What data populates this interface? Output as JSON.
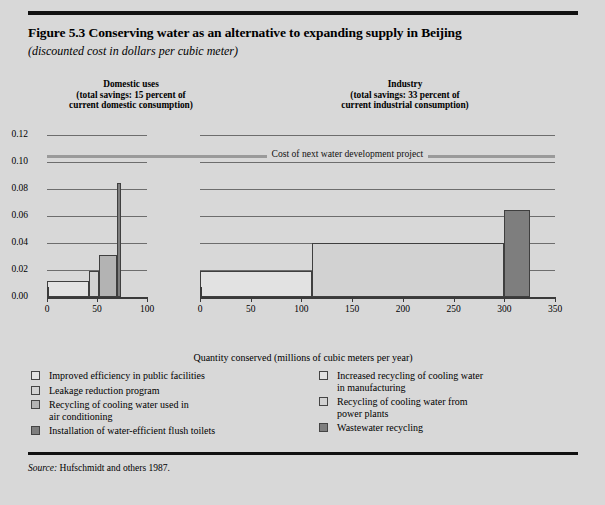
{
  "figure": {
    "title": "Figure 5.3  Conserving water as an alternative to expanding supply in Beijing",
    "subtitle": "(discounted cost in dollars per cubic meter)",
    "source_prefix": "Source:",
    "source_text": " Hufschmidt and others 1987."
  },
  "panels": {
    "left": {
      "heading_line1": "Domestic uses",
      "heading_line2": "(total savings: 15 percent of",
      "heading_line3": "current domestic consumption)"
    },
    "right": {
      "heading_line1": "Industry",
      "heading_line2": "(total savings: 33 percent of",
      "heading_line3": "current industrial consumption)"
    }
  },
  "axes": {
    "x_title": "Quantity conserved (millions of cubic meters per year)",
    "y_ticks": [
      "0.12",
      "0.10",
      "0.08",
      "0.06",
      "0.04",
      "0.02",
      "0.00"
    ],
    "x_ticks_left": [
      "0",
      "50",
      "100"
    ],
    "x_ticks_right": [
      "0",
      "50",
      "100",
      "150",
      "200",
      "250",
      "300",
      "350"
    ]
  },
  "reference_line": {
    "label": "Cost of next water development project",
    "value": 0.105,
    "color": "#9a9a9a"
  },
  "legend": {
    "left": [
      {
        "label": "Improved efficiency in public facilities",
        "color": "#e2e2e2"
      },
      {
        "label": "Leakage reduction program",
        "color": "#d2d2d2"
      },
      {
        "label": "Recycling of cooling water used in\nair conditioning",
        "color": "#b3b3b3"
      },
      {
        "label": "Installation of water-efficient flush toilets",
        "color": "#7e7e7e"
      }
    ],
    "right": [
      {
        "label": "Increased recycling of cooling water\nin manufacturing",
        "color": "#e2e2e2"
      },
      {
        "label": "Recycling of cooling water from\npower plants",
        "color": "#d2d2d2"
      },
      {
        "label": "Wastewater recycling",
        "color": "#7e7e7e"
      }
    ]
  },
  "chart_data": {
    "type": "bar",
    "title": "Figure 5.3  Conserving water as an alternative to expanding supply in Beijing",
    "subtitle": "(discounted cost in dollars per cubic meter)",
    "xlabel": "Quantity conserved (millions of cubic meters per year)",
    "ylabel": "discounted cost in dollars per cubic meter",
    "ylim": [
      0.0,
      0.13
    ],
    "grid": true,
    "legend_position": "below",
    "note": "Stacked step (marginal cost curve) chart: each measure is a block whose width is quantity conserved and whose height is the discounted unit cost.",
    "panels": [
      {
        "name": "Domestic uses",
        "subtitle": "(total savings: 15 percent of current domestic consumption)",
        "xlim": [
          0,
          100
        ],
        "xticks": [
          0,
          50,
          100
        ],
        "blocks": [
          {
            "label": "Improved efficiency in public facilities",
            "x_start": 0,
            "x_end": 42,
            "width": 42,
            "cost": 0.012,
            "color": "#e2e2e2"
          },
          {
            "label": "Leakage reduction program",
            "x_start": 42,
            "x_end": 52,
            "width": 10,
            "cost": 0.019,
            "color": "#d2d2d2"
          },
          {
            "label": "Recycling of cooling water used in air conditioning",
            "x_start": 52,
            "x_end": 70,
            "width": 18,
            "cost": 0.031,
            "color": "#b3b3b3"
          },
          {
            "label": "Installation of water-efficient flush toilets",
            "x_start": 70,
            "x_end": 74,
            "width": 4,
            "cost": 0.085,
            "color": "#7e7e7e"
          }
        ]
      },
      {
        "name": "Industry",
        "subtitle": "(total savings: 33 percent of current industrial consumption)",
        "xlim": [
          0,
          350
        ],
        "xticks": [
          0,
          50,
          100,
          150,
          200,
          250,
          300,
          350
        ],
        "blocks": [
          {
            "label": "Increased recycling of cooling water in manufacturing",
            "x_start": 0,
            "x_end": 110,
            "width": 110,
            "cost": 0.019,
            "color": "#e2e2e2"
          },
          {
            "label": "Recycling of cooling water from power plants",
            "x_start": 110,
            "x_end": 300,
            "width": 190,
            "cost": 0.04,
            "color": "#d2d2d2"
          },
          {
            "label": "Wastewater recycling",
            "x_start": 300,
            "x_end": 325,
            "width": 25,
            "cost": 0.065,
            "color": "#7e7e7e"
          }
        ]
      }
    ],
    "reference_line": {
      "label": "Cost of next water development project",
      "value": 0.105
    }
  }
}
